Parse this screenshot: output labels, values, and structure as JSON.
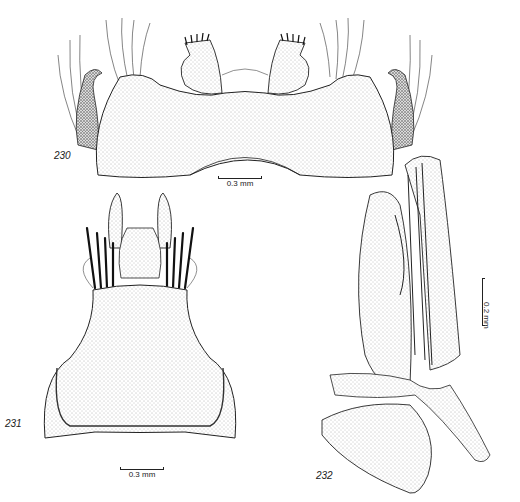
{
  "figures": [
    {
      "number": "230",
      "description": "Male genitalia, dorsal/ventral view with broad stippled tergite-like plate, paired toothed claspers and long setae",
      "scale_bar": "0.3 mm"
    },
    {
      "number": "231",
      "description": "Ventral plate with apical spiny processes and dark bristles",
      "scale_bar": "0.3 mm"
    },
    {
      "number": "232",
      "description": "Lateral view of aedeagus and associated sclerites",
      "scale_bar": "0.2 mm"
    }
  ],
  "colors": {
    "ink": "#222222",
    "stipple": "#9a9a9a",
    "background": "#ffffff"
  }
}
